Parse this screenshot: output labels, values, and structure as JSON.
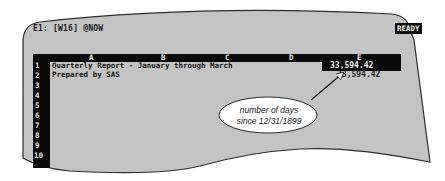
{
  "screen": {
    "status_line": "E1: [W16] @NOW",
    "mode_indicator": "READY",
    "colors": {
      "screen_bg": "#c4c4c4",
      "inverse_bg": "#0a0a0a",
      "inverse_fg": "#e8e8e8",
      "text": "#141414"
    }
  },
  "spreadsheet": {
    "columns": [
      "A",
      "B",
      "C",
      "D",
      "E"
    ],
    "rows": [
      "1",
      "2",
      "3",
      "4",
      "5",
      "6",
      "7",
      "8",
      "9",
      "10"
    ],
    "cells": {
      "A1": "Quarterly Report - January through March",
      "A2": "Prepared by SAS",
      "E1": "33,594.42",
      "E2": "33,594.42"
    },
    "selected_cell": "E1"
  },
  "callout": {
    "line1": "number of days",
    "line2": "since 12/31/1899"
  }
}
